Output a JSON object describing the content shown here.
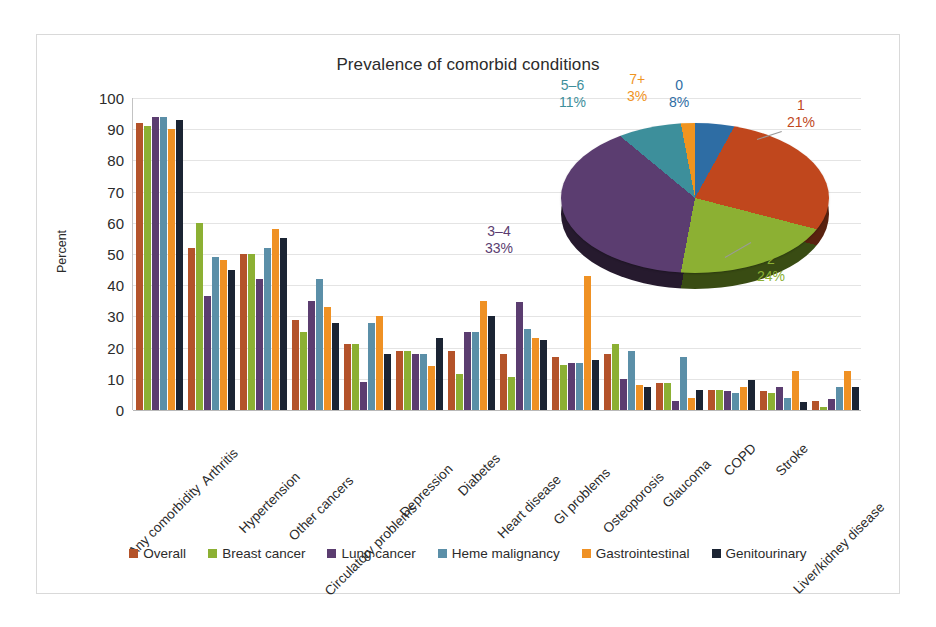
{
  "chart_data": {
    "type": "bar",
    "title": "Prevalence of comorbid conditions",
    "xlabel": "",
    "ylabel": "Percent",
    "ylim": [
      0,
      100
    ],
    "ytick_step": 10,
    "grid": true,
    "legend_position": "bottom",
    "yticks": [
      "100",
      "90",
      "80",
      "70",
      "60",
      "50",
      "40",
      "30",
      "20",
      "10",
      "0"
    ],
    "categories": [
      "Any comorbidity",
      "Arthritis",
      "Hypertension",
      "Other cancers",
      "Circulatory problems",
      "Depression",
      "Diabetes",
      "Heart disease",
      "GI problems",
      "Osteoporosis",
      "Glaucoma",
      "COPD",
      "Stroke",
      "Liver/kidney disease"
    ],
    "series": [
      {
        "name": "Overall",
        "color": "#b4532a",
        "values": [
          92,
          52,
          50,
          29,
          21,
          19,
          19,
          18,
          17,
          18,
          8.5,
          6.5,
          6,
          3
        ]
      },
      {
        "name": "Breast cancer",
        "color": "#8cb033",
        "values": [
          91,
          60,
          50,
          25,
          21,
          19,
          11.5,
          10.5,
          14.5,
          21,
          8.5,
          6.5,
          5.5,
          1
        ]
      },
      {
        "name": "Lung cancer",
        "color": "#5b3d70",
        "values": [
          94,
          36.5,
          42,
          35,
          9,
          18,
          25,
          34.5,
          15,
          10,
          3,
          6,
          7.5,
          3.5
        ]
      },
      {
        "name": "Heme malignancy",
        "color": "#5b8fa8",
        "values": [
          94,
          49,
          52,
          42,
          28,
          18,
          25,
          26,
          15,
          19,
          17,
          5.5,
          4,
          7.5
        ]
      },
      {
        "name": "Gastrointestinal",
        "color": "#ef9124",
        "values": [
          90,
          48,
          58,
          33,
          30,
          14,
          35,
          23,
          43,
          8,
          4,
          7.5,
          12.5,
          12.5
        ]
      },
      {
        "name": "Genitourinary",
        "color": "#1b2433",
        "values": [
          93,
          45,
          55,
          28,
          18,
          23,
          30,
          22.5,
          16,
          7.5,
          6.5,
          9.5,
          2.5,
          7.5
        ]
      }
    ]
  },
  "pie_chart": {
    "type": "pie",
    "title": "",
    "slices": [
      {
        "label": "0",
        "pct_label": "8%",
        "value": 8,
        "color": "#2e6da4"
      },
      {
        "label": "1",
        "pct_label": "21%",
        "value": 21,
        "color": "#c0471d"
      },
      {
        "label": "2",
        "pct_label": "24%",
        "value": 24,
        "color": "#8cb033"
      },
      {
        "label": "3–4",
        "pct_label": "33%",
        "value": 33,
        "color": "#5b3d70"
      },
      {
        "label": "5–6",
        "pct_label": "11%",
        "value": 11,
        "color": "#3d8f9b"
      },
      {
        "label": "7+",
        "pct_label": "3%",
        "value": 3,
        "color": "#f0941f"
      }
    ]
  },
  "legend": {
    "items": [
      {
        "label": "Overall",
        "color": "#b4532a"
      },
      {
        "label": "Breast cancer",
        "color": "#8cb033"
      },
      {
        "label": "Lung cancer",
        "color": "#5b3d70"
      },
      {
        "label": "Heme malignancy",
        "color": "#5b8fa8"
      },
      {
        "label": "Gastrointestinal",
        "color": "#ef9124"
      },
      {
        "label": "Genitourinary",
        "color": "#1b2433"
      }
    ]
  }
}
